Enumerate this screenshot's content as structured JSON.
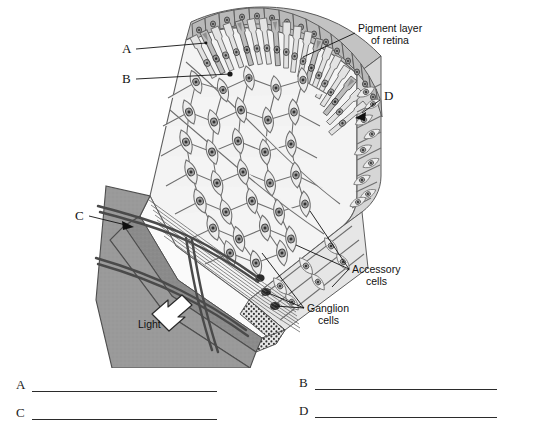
{
  "figure": {
    "named_labels": [
      {
        "id": "pigment-layer",
        "text_line1": "Pigment layer",
        "text_line2": "of retina"
      },
      {
        "id": "accessory-cells",
        "text_line1": "Accessory",
        "text_line2": "cells"
      },
      {
        "id": "ganglion-cells",
        "text_line1": "Ganglion",
        "text_line2": "cells"
      },
      {
        "id": "light",
        "text_line1": "Light",
        "text_line2": ""
      }
    ],
    "letter_callouts": [
      {
        "letter": "A",
        "pointer": "line"
      },
      {
        "letter": "B",
        "pointer": "line"
      },
      {
        "letter": "C",
        "pointer": "arrow"
      },
      {
        "letter": "D",
        "pointer": "arrow"
      }
    ],
    "colors": {
      "background": "#ffffff",
      "ink": "#111111",
      "cell_fill": "#f2f2f2",
      "cell_outline": "#6e6e6e",
      "pigment_fill": "#b9b9b9",
      "choroid_fill": "#9a9a9a",
      "nucleus_fill": "#9a9a9a",
      "vessel": "#4a4a4a"
    }
  },
  "answers": {
    "rows": [
      {
        "letter": "A",
        "value": "",
        "side": "left",
        "row": 1
      },
      {
        "letter": "B",
        "value": "",
        "side": "right",
        "row": 1
      },
      {
        "letter": "C",
        "value": "",
        "side": "left",
        "row": 2
      },
      {
        "letter": "D",
        "value": "",
        "side": "right",
        "row": 2
      }
    ]
  }
}
